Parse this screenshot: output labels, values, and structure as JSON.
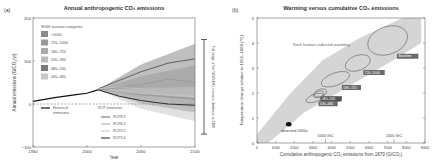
{
  "chart_data": [
    {
      "panel": "(a)",
      "type": "area",
      "title": "Annual anthropogenic CO₂ emissions",
      "xlabel": "Year",
      "ylabel": "Annual emissions (GtCO₂/yr)",
      "xlim": [
        1950,
        2100
      ],
      "ylim": [
        -100,
        200
      ],
      "x_ticks": [
        "1950",
        "2000",
        "2050",
        "2100"
      ],
      "y_ticks": [
        "-100",
        "0",
        "100",
        "200"
      ],
      "legend_categories_title": "WGIII scenario categories:",
      "categories": [
        {
          "name": ">1000",
          "color": "#8a8a8a",
          "range_2100": [
            40,
            140
          ]
        },
        {
          "name": "720–1000",
          "color": "#9a9a9a",
          "range_2100": [
            20,
            90
          ]
        },
        {
          "name": "580–720",
          "color": "#aaaaaa",
          "range_2100": [
            0,
            60
          ]
        },
        {
          "name": "530–580",
          "color": "#bcbcbc",
          "range_2100": [
            -10,
            35
          ]
        },
        {
          "name": "480–530",
          "color": "#7a7a7a",
          "range_2100": [
            -20,
            15
          ]
        },
        {
          "name": "430–480",
          "color": "#c8c8c8",
          "range_2100": [
            -40,
            10
          ]
        }
      ],
      "historical": {
        "label": "Historical emissions",
        "x": [
          1950,
          1970,
          1990,
          2000,
          2010
        ],
        "y": [
          6,
          15,
          22,
          25,
          33
        ]
      },
      "rcp_title": "RCP scenarios:",
      "series": [
        {
          "name": "RCP8.5",
          "x": [
            2010,
            2030,
            2050,
            2075,
            2100
          ],
          "values": [
            35,
            55,
            75,
            95,
            105
          ]
        },
        {
          "name": "RCP6.0",
          "x": [
            2010,
            2030,
            2050,
            2075,
            2100
          ],
          "values": [
            33,
            38,
            45,
            58,
            50
          ]
        },
        {
          "name": "RCP4.5",
          "x": [
            2010,
            2030,
            2050,
            2075,
            2100
          ],
          "values": [
            35,
            40,
            35,
            20,
            15
          ]
        },
        {
          "name": "RCP2.6",
          "x": [
            2010,
            2030,
            2050,
            2075,
            2100
          ],
          "values": [
            33,
            18,
            8,
            0,
            -3
          ]
        }
      ],
      "side_bar_label": "Full range of the WGIII AR5 scenario database in 2100",
      "side_bar_range": [
        -70,
        150
      ]
    },
    {
      "panel": "(b)",
      "type": "scatter",
      "title": "Warming versus cumulative CO₂ emissions",
      "xlabel": "Cumulative anthropogenic CO₂ emissions from 1870 (GtCO₂)",
      "ylabel": "Temperature change relative to 1861–1880 (°C)",
      "xlim": [
        0,
        9000
      ],
      "ylim": [
        0,
        5
      ],
      "x_ticks": [
        "0",
        "1000",
        "2000",
        "3000",
        "4000",
        "5000",
        "6000",
        "7000",
        "8000",
        "9000"
      ],
      "y_ticks": [
        "0",
        "1",
        "2",
        "3",
        "4",
        "5"
      ],
      "band_label": "Total human-induced warming",
      "top_axis_marks": [
        {
          "label": "1000 GtC",
          "x": 3670
        },
        {
          "label": "2000 GtC",
          "x": 7340
        }
      ],
      "observed": {
        "label": "observed 2000s",
        "x": 1700,
        "y": 0.75
      },
      "ellipses": [
        {
          "label": "Baseline",
          "cx": 7000,
          "cy": 4.1,
          "rx": 1100,
          "ry": 0.55
        },
        {
          "label": "720–1000",
          "cx": 5400,
          "cy": 3.2,
          "rx": 700,
          "ry": 0.3
        },
        {
          "label": "580–720",
          "cx": 4200,
          "cy": 2.55,
          "rx": 800,
          "ry": 0.25
        },
        {
          "label": "530–580",
          "cx": 3400,
          "cy": 2.0,
          "rx": 350,
          "ry": 0.15
        },
        {
          "label": "480–530",
          "cx": 3300,
          "cy": 1.95,
          "rx": 300,
          "ry": 0.12
        },
        {
          "label": "430–480",
          "cx": 3100,
          "cy": 1.8,
          "rx": 500,
          "ry": 0.15
        }
      ]
    }
  ]
}
